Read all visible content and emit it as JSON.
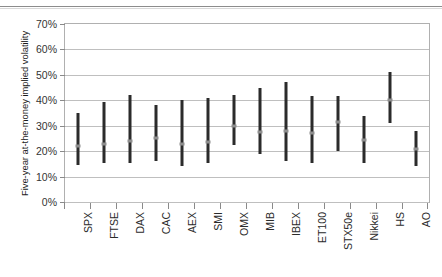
{
  "page": {
    "clipped_header_text": "..."
  },
  "chart_data": {
    "type": "bar",
    "subtype": "floating-range-bar",
    "title": "",
    "xlabel": "",
    "ylabel": "Five-year at-the-money implied volatility",
    "ylim": [
      0,
      70
    ],
    "ytick_values": [
      0,
      10,
      20,
      30,
      40,
      50,
      60,
      70
    ],
    "ytick_labels": [
      "0%",
      "10%",
      "20%",
      "30%",
      "40%",
      "50%",
      "60%",
      "70%"
    ],
    "grid": true,
    "legend": "none",
    "categories": [
      "SPX",
      "FTSE",
      "DAX",
      "CAC",
      "AEX",
      "SMI",
      "OMX",
      "MIB",
      "IBEX",
      "ET100",
      "STX50e",
      "Nikkei",
      "HS",
      "AO"
    ],
    "series": [
      {
        "name": "High",
        "values": [
          35.0,
          39.5,
          42.0,
          38.0,
          40.0,
          41.0,
          42.0,
          45.0,
          47.0,
          41.5,
          41.5,
          34.0,
          51.0,
          28.0
        ]
      },
      {
        "name": "Low",
        "values": [
          14.5,
          15.5,
          15.5,
          16.0,
          14.0,
          15.5,
          22.5,
          19.0,
          16.0,
          15.5,
          20.0,
          15.5,
          31.0,
          14.0
        ]
      },
      {
        "name": "Current",
        "values": [
          22.0,
          23.0,
          24.0,
          25.0,
          23.0,
          23.5,
          30.0,
          27.5,
          28.0,
          27.0,
          31.5,
          24.5,
          40.0,
          21.0
        ]
      }
    ],
    "colors": {
      "bar": "#2b2b2b",
      "marker": "#8e8e8e",
      "grid": "#bfbfbf",
      "axis": "#b0b0b0"
    }
  }
}
